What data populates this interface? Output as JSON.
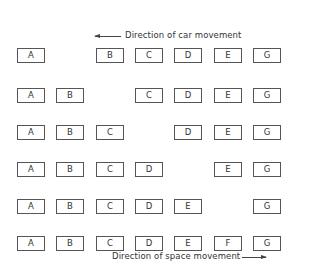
{
  "captions": {
    "top": "Direction of car movement",
    "bottom": "Direction of space movement"
  },
  "columns": [
    "A",
    "B",
    "C",
    "D",
    "E",
    "F",
    "G"
  ],
  "rows": [
    {
      "cars": [
        "A",
        "",
        "B",
        "C",
        "D",
        "E",
        "F",
        "G"
      ],
      "empty_index": 1
    },
    {
      "empty_index": 2
    },
    {
      "empty_index": 3
    },
    {
      "empty_index": 4
    },
    {
      "empty_index": 5
    },
    {
      "empty_index": 6
    }
  ],
  "grid": [
    [
      "A",
      "",
      "B",
      "C",
      "D",
      "E",
      "F",
      "G"
    ],
    [
      "A",
      "B",
      "",
      "C",
      "D",
      "E",
      "F",
      "G"
    ],
    [
      "A",
      "B",
      "C",
      "",
      "D",
      "E",
      "F",
      "G"
    ],
    [
      "A",
      "B",
      "C",
      "D",
      "",
      "E",
      "F",
      "G"
    ],
    [
      "A",
      "B",
      "C",
      "D",
      "E",
      "",
      "F",
      "G"
    ],
    [
      "A",
      "B",
      "C",
      "D",
      "E",
      "F",
      "",
      "G"
    ]
  ]
}
